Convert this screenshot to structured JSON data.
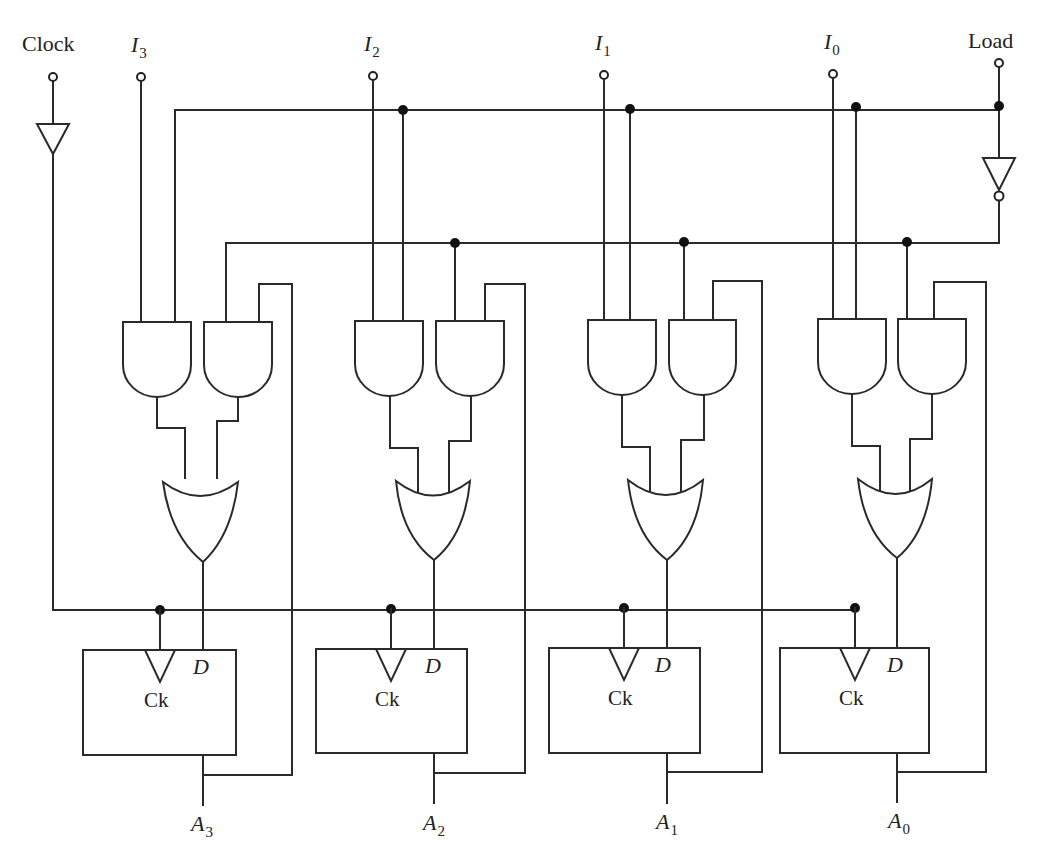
{
  "diagram": {
    "type": "4-bit register with parallel load (logic circuit)",
    "inputs": {
      "clock": "Clock",
      "load": "Load",
      "data": [
        {
          "base": "I",
          "sub": "3"
        },
        {
          "base": "I",
          "sub": "2"
        },
        {
          "base": "I",
          "sub": "1"
        },
        {
          "base": "I",
          "sub": "0"
        }
      ]
    },
    "outputs": [
      {
        "base": "A",
        "sub": "3"
      },
      {
        "base": "A",
        "sub": "2"
      },
      {
        "base": "A",
        "sub": "1"
      },
      {
        "base": "A",
        "sub": "0"
      }
    ],
    "flipflop": {
      "d_label": "D",
      "clock_label": "Ck"
    },
    "gates_per_bit": [
      "AND",
      "AND",
      "OR"
    ],
    "buffers": [
      "clock-buffer",
      "load-inverter"
    ],
    "colors": {
      "wire": "#2a2a2a",
      "background": "#ffffff"
    }
  }
}
